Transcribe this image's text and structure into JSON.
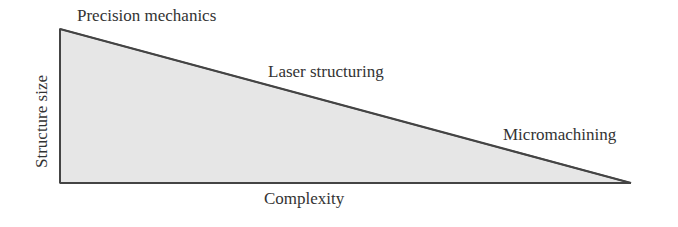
{
  "diagram": {
    "axes": {
      "x_label": "Complexity",
      "y_label": "Structure size"
    },
    "labels": {
      "top": "Precision mechanics",
      "middle": "Laser structuring",
      "bottom": "Micromachining"
    },
    "shape": {
      "type": "right-triangle",
      "fill": "#e6e6e6",
      "stroke": "#444444"
    }
  }
}
